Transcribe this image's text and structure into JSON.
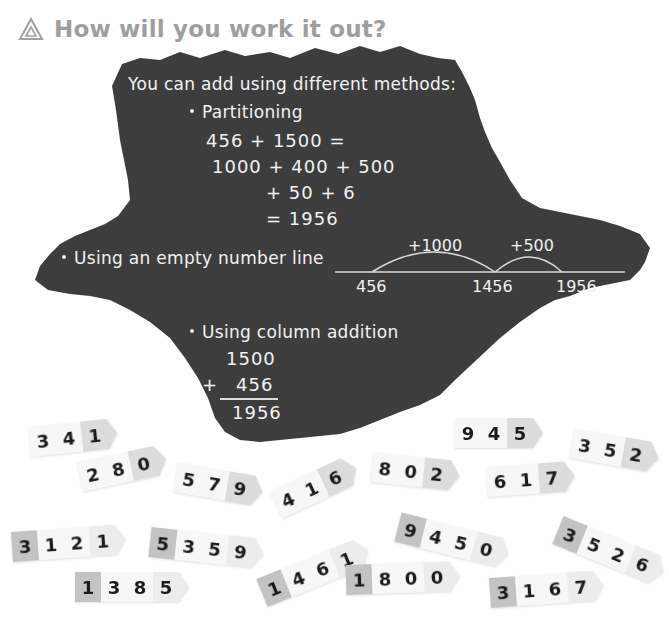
{
  "heading": {
    "icon": "triangle-icon",
    "title": "How will you work it out?"
  },
  "board": {
    "intro": "You can add using different methods:",
    "partitioning": {
      "label": "Partitioning",
      "lines": [
        "456 + 1500 =",
        "1000 + 400 + 500",
        "+ 50 + 6",
        "= 1956"
      ]
    },
    "number_line": {
      "label": "Using an empty number line",
      "jumps": [
        "+1000",
        "+500"
      ],
      "marks": [
        "456",
        "1456",
        "1956"
      ]
    },
    "column": {
      "label": "Using column addition",
      "top": "1500",
      "plus": "+",
      "bottom": "456",
      "result": "1956"
    }
  },
  "cards": [
    {
      "digits": [
        "3",
        "4",
        "1"
      ],
      "x": 30,
      "y": 427,
      "rot": -6
    },
    {
      "digits": [
        "2",
        "8",
        "0"
      ],
      "x": 80,
      "y": 462,
      "rot": -12
    },
    {
      "digits": [
        "5",
        "7",
        "9"
      ],
      "x": 176,
      "y": 462,
      "rot": 10
    },
    {
      "digits": [
        "4",
        "1",
        "6"
      ],
      "x": 276,
      "y": 490,
      "rot": -25
    },
    {
      "digits": [
        "8",
        "0",
        "2"
      ],
      "x": 372,
      "y": 452,
      "rot": 6
    },
    {
      "digits": [
        "9",
        "4",
        "5"
      ],
      "x": 455,
      "y": 418,
      "rot": 0
    },
    {
      "digits": [
        "6",
        "1",
        "7"
      ],
      "x": 487,
      "y": 467,
      "rot": -4
    },
    {
      "digits": [
        "3",
        "5",
        "2"
      ],
      "x": 572,
      "y": 428,
      "rot": 10
    },
    {
      "digits": [
        "3",
        "1",
        "2",
        "1"
      ],
      "x": 12,
      "y": 532,
      "rot": -4
    },
    {
      "digits": [
        "5",
        "3",
        "5",
        "9"
      ],
      "x": 150,
      "y": 527,
      "rot": 6
    },
    {
      "digits": [
        "1",
        "3",
        "8",
        "5"
      ],
      "x": 75,
      "y": 572,
      "rot": 0
    },
    {
      "digits": [
        "1",
        "4",
        "6",
        "1"
      ],
      "x": 262,
      "y": 578,
      "rot": -22
    },
    {
      "digits": [
        "9",
        "4",
        "5",
        "0"
      ],
      "x": 398,
      "y": 512,
      "rot": 14
    },
    {
      "digits": [
        "1",
        "8",
        "0",
        "0"
      ],
      "x": 346,
      "y": 565,
      "rot": -2
    },
    {
      "digits": [
        "3",
        "5",
        "2",
        "6"
      ],
      "x": 558,
      "y": 515,
      "rot": 22
    },
    {
      "digits": [
        "3",
        "1",
        "6",
        "7"
      ],
      "x": 490,
      "y": 578,
      "rot": -4
    }
  ]
}
